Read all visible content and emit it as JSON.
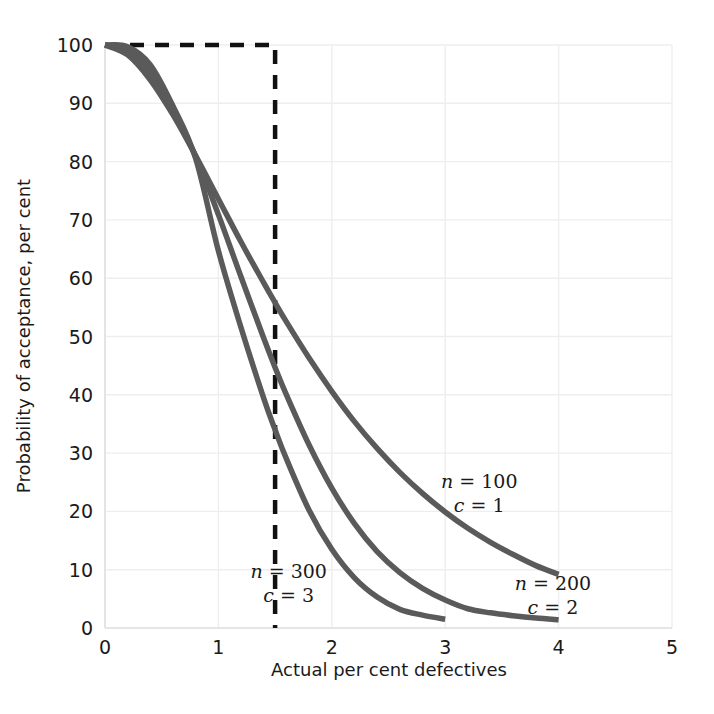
{
  "chart_data": {
    "type": "line",
    "title": "",
    "xlabel": "Actual per cent defectives",
    "ylabel": "Probability of acceptance, per cent",
    "xlim": [
      0,
      5
    ],
    "ylim": [
      0,
      100
    ],
    "xticks": [
      "0",
      "1",
      "2",
      "3",
      "4",
      "5"
    ],
    "yticks": [
      "0",
      "10",
      "20",
      "30",
      "40",
      "50",
      "60",
      "70",
      "80",
      "90",
      "100"
    ],
    "grid": true,
    "legend_position": "inline-annotations",
    "curve_color": "#5a5a5a",
    "grid_color": "#eeeeee",
    "reference_line": {
      "name": "acceptable-quality-level-box",
      "style": "dashed",
      "color": "#111111",
      "x": 1.5,
      "y": 100,
      "description": "Ideal OC curve: horizontal dashed segment at 100% from x=0 to x=1.5, then vertical dashed drop to 0%"
    },
    "series": [
      {
        "name": "n = 100, c = 1",
        "n": 100,
        "c": 1,
        "label_line1": "n = 100",
        "label_line2": "c = 1",
        "label_x": 3.3,
        "label_y": 24,
        "x": [
          0.0,
          0.2,
          0.4,
          0.6,
          0.8,
          1.0,
          1.2,
          1.4,
          1.5,
          1.6,
          1.8,
          2.0,
          2.2,
          2.4,
          2.6,
          2.8,
          3.0,
          3.2,
          3.4,
          3.6,
          3.8,
          4.0
        ],
        "y": [
          100.0,
          98.3,
          94.0,
          88.0,
          81.0,
          73.6,
          66.2,
          59.2,
          55.8,
          52.5,
          46.3,
          40.6,
          35.4,
          30.8,
          26.7,
          23.1,
          19.9,
          17.1,
          14.7,
          12.6,
          10.7,
          9.2
        ]
      },
      {
        "name": "n = 200, c = 2",
        "n": 200,
        "c": 2,
        "label_line1": "n = 200",
        "label_line2": "c = 2",
        "label_x": 3.95,
        "label_y": 6.5,
        "x": [
          0.0,
          0.2,
          0.4,
          0.6,
          0.8,
          1.0,
          1.2,
          1.4,
          1.5,
          1.6,
          1.8,
          2.0,
          2.2,
          2.4,
          2.6,
          2.8,
          3.0,
          3.2,
          3.4,
          3.6,
          3.8,
          4.0
        ],
        "y": [
          100.0,
          99.2,
          95.3,
          88.4,
          80.9,
          70.9,
          60.2,
          49.7,
          44.7,
          40.0,
          31.4,
          24.0,
          17.9,
          13.1,
          9.5,
          6.8,
          4.8,
          3.3,
          2.6,
          2.1,
          1.7,
          1.4
        ]
      },
      {
        "name": "n = 300, c = 3",
        "n": 300,
        "c": 3,
        "label_line1": "n = 300",
        "label_line2": "c = 3",
        "label_x": 1.62,
        "label_y": 8.5,
        "x": [
          0.0,
          0.2,
          0.4,
          0.6,
          0.8,
          1.0,
          1.2,
          1.4,
          1.5,
          1.6,
          1.8,
          2.0,
          2.2,
          2.4,
          2.6,
          2.8,
          3.0
        ],
        "y": [
          100.0,
          99.7,
          96.6,
          89.5,
          80.5,
          64.7,
          51.5,
          39.4,
          34.0,
          29.0,
          20.2,
          13.5,
          8.6,
          5.3,
          3.2,
          2.2,
          1.5
        ]
      }
    ]
  },
  "axes": {
    "x_title": "Actual per cent defectives",
    "y_title": "Probability of acceptance, per cent"
  }
}
